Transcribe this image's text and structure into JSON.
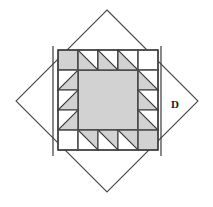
{
  "figure": {
    "canvas": {
      "width": 213,
      "height": 207
    },
    "dimension_label": "D",
    "colors": {
      "background": "#ffffff",
      "patch_fill": "#d2d2d2",
      "center_fill": "#d2d2d2",
      "empty_fill": "#ffffff",
      "outline": "#3a3a3a",
      "grid_line": "#555555",
      "diamond_stroke": "#4a4a4a",
      "label_color": "#1a1a1a"
    },
    "diamond": {
      "name": "rotated-square-outline",
      "center_x": 107,
      "center_y": 101,
      "half_diagonal_x": 91,
      "half_diagonal_y": 91,
      "vertices": [
        {
          "x": 107,
          "y": 10
        },
        {
          "x": 198,
          "y": 101
        },
        {
          "x": 107,
          "y": 192
        },
        {
          "x": 16,
          "y": 101
        }
      ]
    },
    "dimension_lines": [
      {
        "name": "left-dimension-line",
        "x": 53,
        "y1": 46,
        "y2": 156
      },
      {
        "name": "right-dimension-line",
        "x": 161,
        "y1": 46,
        "y2": 156
      }
    ],
    "label_position": {
      "x": 175,
      "y": 105
    },
    "block": {
      "name": "sawtooth-quilt-block",
      "x": 58,
      "y": 50,
      "width": 100,
      "height": 100,
      "grid_cols": 5,
      "grid_rows": 5,
      "cell_size": 20,
      "center_span": {
        "col_start": 1,
        "col_end": 4,
        "row_start": 1,
        "row_end": 4
      },
      "cells": [
        {
          "row": 0,
          "col": 0,
          "type": "solid",
          "fill": "patch"
        },
        {
          "row": 0,
          "col": 1,
          "type": "triangle",
          "corner": "bottom-left"
        },
        {
          "row": 0,
          "col": 2,
          "type": "triangle",
          "corner": "bottom-left"
        },
        {
          "row": 0,
          "col": 3,
          "type": "triangle",
          "corner": "bottom-left"
        },
        {
          "row": 0,
          "col": 4,
          "type": "empty",
          "fill": "empty"
        },
        {
          "row": 1,
          "col": 0,
          "type": "triangle",
          "corner": "bottom-right"
        },
        {
          "row": 1,
          "col": 4,
          "type": "triangle",
          "corner": "bottom-left"
        },
        {
          "row": 2,
          "col": 0,
          "type": "triangle",
          "corner": "bottom-right"
        },
        {
          "row": 2,
          "col": 4,
          "type": "triangle",
          "corner": "bottom-left"
        },
        {
          "row": 3,
          "col": 0,
          "type": "triangle",
          "corner": "bottom-right"
        },
        {
          "row": 3,
          "col": 4,
          "type": "triangle",
          "corner": "bottom-left"
        },
        {
          "row": 4,
          "col": 0,
          "type": "empty",
          "fill": "empty"
        },
        {
          "row": 4,
          "col": 1,
          "type": "triangle",
          "corner": "top-right"
        },
        {
          "row": 4,
          "col": 2,
          "type": "triangle",
          "corner": "top-right"
        },
        {
          "row": 4,
          "col": 3,
          "type": "triangle",
          "corner": "top-right"
        },
        {
          "row": 4,
          "col": 4,
          "type": "solid",
          "fill": "patch"
        }
      ]
    }
  }
}
